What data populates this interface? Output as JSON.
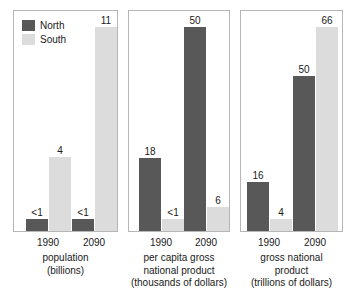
{
  "legend": {
    "items": [
      {
        "label": "North",
        "color": "#585858",
        "key": "north"
      },
      {
        "label": "South",
        "color": "#dcdcdc",
        "key": "south"
      }
    ]
  },
  "chart_data": [
    {
      "type": "bar",
      "title": "population",
      "units": "(billions)",
      "xlabel": "",
      "ylabel": "population (billions)",
      "categories": [
        "1990",
        "2090"
      ],
      "ylim": [
        0,
        11
      ],
      "grid": false,
      "legend_position": "top-left",
      "series": [
        {
          "name": "North",
          "color": "#585858",
          "values": [
            0.5,
            0.5
          ],
          "labels": [
            "<1",
            "<1"
          ]
        },
        {
          "name": "South",
          "color": "#dcdcdc",
          "values": [
            4,
            11
          ],
          "labels": [
            "4",
            "11"
          ]
        }
      ]
    },
    {
      "type": "bar",
      "title": "per capita gross national product",
      "units": "(thousands of dollars)",
      "xlabel": "",
      "ylabel": "per capita gross national product (thousands of dollars)",
      "categories": [
        "1990",
        "2090"
      ],
      "ylim": [
        0,
        50
      ],
      "grid": false,
      "legend_position": "none",
      "series": [
        {
          "name": "North",
          "color": "#585858",
          "values": [
            18,
            50
          ],
          "labels": [
            "18",
            "50"
          ]
        },
        {
          "name": "South",
          "color": "#dcdcdc",
          "values": [
            0.5,
            6
          ],
          "labels": [
            "<1",
            "6"
          ]
        }
      ]
    },
    {
      "type": "bar",
      "title": "gross national product",
      "units": "(trillions of dollars)",
      "xlabel": "",
      "ylabel": "gross national product (trillions of dollars)",
      "categories": [
        "1990",
        "2090"
      ],
      "ylim": [
        0,
        66
      ],
      "grid": false,
      "legend_position": "none",
      "series": [
        {
          "name": "North",
          "color": "#585858",
          "values": [
            16,
            50
          ],
          "labels": [
            "16",
            "50"
          ]
        },
        {
          "name": "South",
          "color": "#dcdcdc",
          "values": [
            4,
            66
          ],
          "labels": [
            "4",
            "66"
          ]
        }
      ]
    }
  ],
  "panels": [
    {
      "ticks": [
        "1990",
        "2090"
      ],
      "caption_lines": [
        "population",
        "(billions)"
      ]
    },
    {
      "ticks": [
        "1990",
        "2090"
      ],
      "caption_lines": [
        "per capita gross",
        "national product",
        "(thousands of dollars)"
      ]
    },
    {
      "ticks": [
        "1990",
        "2090"
      ],
      "caption_lines": [
        "gross national",
        "product",
        "(trillions of dollars)"
      ]
    }
  ]
}
